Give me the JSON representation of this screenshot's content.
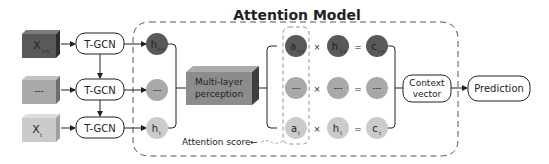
{
  "title": "Attention Model",
  "colors": {
    "dark": "#595959",
    "dark_side": "#2e2e2e",
    "dark_top": "#7a7a7a",
    "mid": "#a9a9a9",
    "mid_side": "#6e6e6e",
    "mid_top": "#c2c2c2",
    "light": "#cbcbcb",
    "light_side": "#a0a0a0",
    "light_top": "#dedede",
    "mlp": "#8c8c8c",
    "mlp_side": "#3e3e3e",
    "mlp_top": "#ababab",
    "line": "#222222",
    "dash": "#555555"
  },
  "inputs": [
    {
      "label": "X",
      "sub": "t-n",
      "tone": "dark"
    },
    {
      "label": "---",
      "sub": "",
      "tone": "mid"
    },
    {
      "label": "X",
      "sub": "t",
      "tone": "light"
    }
  ],
  "tgcn": [
    {
      "label": "T-GCN"
    },
    {
      "label": "T-GCN"
    },
    {
      "label": "T-GCN"
    }
  ],
  "hidden_states": [
    {
      "label": "h",
      "sub": "t-n",
      "tone": "dark"
    },
    {
      "label": "---",
      "sub": "",
      "tone": "mid"
    },
    {
      "label": "h",
      "sub": "t",
      "tone": "light"
    }
  ],
  "mlp": {
    "line1": "Multi-layer",
    "line2": "perception"
  },
  "attention_rows": [
    {
      "a": {
        "label": "a",
        "sub": "t-n"
      },
      "h": {
        "label": "h",
        "sub": "t-n"
      },
      "c": {
        "label": "c",
        "sub": "t-n"
      },
      "tone": "dark"
    },
    {
      "a": {
        "label": "---",
        "sub": ""
      },
      "h": {
        "label": "---",
        "sub": ""
      },
      "c": {
        "label": "---",
        "sub": ""
      },
      "tone": "mid"
    },
    {
      "a": {
        "label": "a",
        "sub": "t"
      },
      "h": {
        "label": "h",
        "sub": "t"
      },
      "c": {
        "label": "c",
        "sub": "t"
      },
      "tone": "light"
    }
  ],
  "operators": {
    "times": "×",
    "equals": "="
  },
  "attention_score": {
    "label": "Attention score",
    "arrow": "←"
  },
  "context_vector": {
    "line1": "Context",
    "line2": "vector"
  },
  "prediction": {
    "label": "Prediction"
  }
}
